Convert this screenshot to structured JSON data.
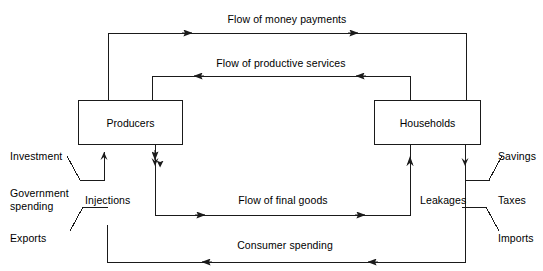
{
  "diagram": {
    "type": "circular-flow-diagram",
    "line_color": "#1a1a1a",
    "text_color": "#000000",
    "background": "#ffffff"
  },
  "nodes": {
    "producers": {
      "label": "Producers",
      "x": 78,
      "y": 100,
      "width": 105,
      "height": 45
    },
    "households": {
      "label": "Households",
      "x": 374,
      "y": 100,
      "width": 107,
      "height": 45
    }
  },
  "flows": [
    {
      "id": "money-payments",
      "label": "Flow of money payments",
      "direction": "right",
      "from": "producers",
      "to": "households",
      "y": 33,
      "x_start": 108,
      "x_end": 466
    },
    {
      "id": "productive-services",
      "label": "Flow of productive services",
      "direction": "left",
      "from": "households",
      "to": "producers",
      "y": 76,
      "x_start": 152,
      "x_end": 410
    },
    {
      "id": "final-goods",
      "label": "Flow of final goods",
      "direction": "right",
      "from": "producers",
      "to": "households",
      "y": 215,
      "x_start": 155,
      "x_end": 410
    },
    {
      "id": "consumer-spending",
      "label": "Consumer spending",
      "direction": "left",
      "from": "households",
      "to": "producers",
      "y": 262,
      "x_start": 107,
      "x_end": 465
    }
  ],
  "injections": {
    "group_label": "Injections",
    "items": [
      {
        "label": "Investment"
      },
      {
        "label": "Government\nspending"
      },
      {
        "label": "Exports"
      }
    ]
  },
  "leakages": {
    "group_label": "Leakages",
    "items": [
      {
        "label": "Savings"
      },
      {
        "label": "Taxes"
      },
      {
        "label": "Imports"
      }
    ]
  }
}
